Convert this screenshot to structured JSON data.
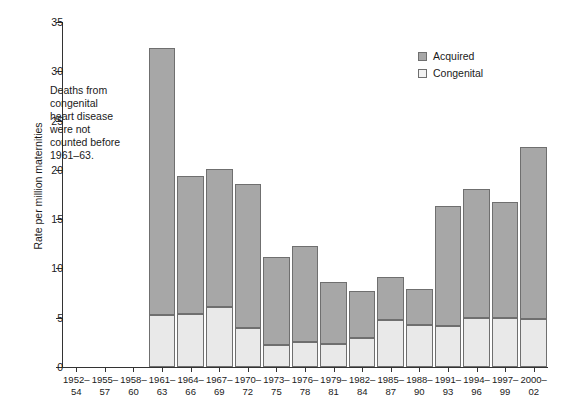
{
  "chart_data": {
    "type": "bar",
    "stacked": true,
    "title": "",
    "xlabel": "",
    "ylabel": "Rate per million maternities",
    "ylim": [
      0,
      35
    ],
    "ytick_step": 5,
    "yticks": [
      0,
      5,
      10,
      15,
      20,
      25,
      30,
      35
    ],
    "grid": false,
    "legend_position": "top-right",
    "categories": [
      "1952–\n54",
      "1955–\n57",
      "1958–\n60",
      "1961–\n63",
      "1964–\n66",
      "1967–\n69",
      "1970–\n72",
      "1973–\n75",
      "1976–\n78",
      "1979–\n81",
      "1982–\n84",
      "1985–\n87",
      "1988–\n90",
      "1991–\n93",
      "1994–\n96",
      "1997–\n99",
      "2000–\n02"
    ],
    "series": [
      {
        "name": "Congenital",
        "color": "#e9e9e9",
        "values": [
          null,
          null,
          null,
          5.3,
          5.4,
          6.1,
          4.0,
          2.2,
          2.5,
          2.3,
          2.9,
          4.8,
          4.3,
          4.2,
          5.0,
          5.0,
          4.9
        ]
      },
      {
        "name": "Acquired",
        "color": "#a7a7a7",
        "values": [
          null,
          null,
          null,
          27.0,
          13.9,
          13.9,
          14.5,
          8.9,
          9.7,
          6.2,
          4.7,
          4.2,
          3.5,
          12.0,
          13.0,
          11.6,
          17.3
        ]
      }
    ],
    "totals": [
      null,
      null,
      null,
      32.3,
      19.3,
      20.0,
      18.5,
      11.1,
      12.2,
      8.5,
      7.6,
      9.0,
      7.8,
      16.2,
      18.0,
      16.6,
      22.2
    ],
    "annotations": [
      {
        "name": "congenital-note",
        "text": "Deaths from\ncongenital\nheart disease\nwere not\ncounted before\n1961–63."
      }
    ]
  },
  "legend": {
    "items": [
      {
        "label": "Acquired",
        "swatch": "acquired-swatch"
      },
      {
        "label": "Congenital",
        "swatch": "congenital-swatch"
      }
    ]
  }
}
